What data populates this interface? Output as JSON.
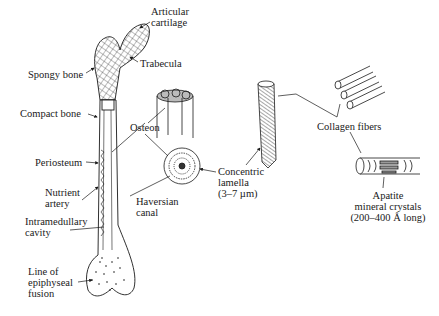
{
  "diagram": {
    "labels": {
      "articular_cartilage": [
        "Articular",
        "cartilage"
      ],
      "trabecula": "Trabecula",
      "spongy_bone": "Spongy bone",
      "compact_bone": "Compact bone",
      "osteon": "Osteon",
      "periosteum": "Periosteum",
      "nutrient_artery": [
        "Nutrient",
        "artery"
      ],
      "intramedullary_cavity": [
        "Intramedullary",
        "cavity"
      ],
      "line_of_epiphyseal_fusion": [
        "Line of",
        "epiphyseal",
        "fusion"
      ],
      "haversian_canal": [
        "Haversian",
        "canal"
      ],
      "concentric_lamella": [
        "Concentric",
        "lamella",
        "(3–7 µm)"
      ],
      "collagen_fibers": "Collagen fibers",
      "apatite_crystals": [
        "Apatite",
        "mineral crystals",
        "(200–400 Å long)"
      ]
    },
    "colors": {
      "ink": "#1a1a1a",
      "background": "#ffffff"
    }
  }
}
